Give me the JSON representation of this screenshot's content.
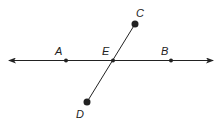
{
  "diagram": {
    "title": "",
    "line_AB": {
      "label": "line AB",
      "y": 60.5,
      "x_start": 8,
      "x_end": 214,
      "arrow_both_ends": true
    },
    "segment_CD": {
      "label": "segment CD",
      "from": "C",
      "to": "D"
    },
    "points": [
      {
        "name": "A",
        "label": "A",
        "x": 66,
        "y": 60.5,
        "lx": 55,
        "ly": 55,
        "r": 2
      },
      {
        "name": "E",
        "label": "E",
        "x": 113,
        "y": 60.5,
        "lx": 102,
        "ly": 55,
        "r": 2
      },
      {
        "name": "B",
        "label": "B",
        "x": 171,
        "y": 60.5,
        "lx": 161,
        "ly": 55,
        "r": 2
      },
      {
        "name": "C",
        "label": "C",
        "x": 135,
        "y": 24,
        "lx": 136,
        "ly": 17,
        "r": 3.5
      },
      {
        "name": "D",
        "label": "D",
        "x": 87,
        "y": 102,
        "lx": 76,
        "ly": 118,
        "r": 3.5
      }
    ],
    "colors": {
      "stroke": "#222222",
      "background": "#ffffff"
    }
  }
}
